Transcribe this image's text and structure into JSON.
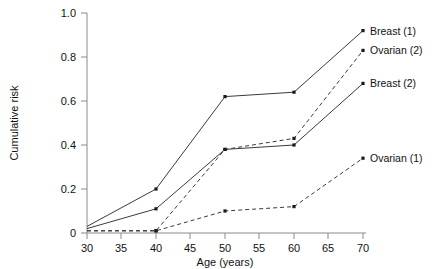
{
  "chart_data": {
    "type": "line",
    "title": "",
    "xlabel": "Age (years)",
    "ylabel": "Cumulative risk",
    "xlim": [
      30,
      70
    ],
    "ylim": [
      0,
      1.0
    ],
    "xticks": [
      30,
      35,
      40,
      45,
      50,
      55,
      60,
      65,
      70
    ],
    "xtick_labels": [
      "30",
      "35",
      "40",
      "45",
      "50",
      "55",
      "60",
      "65",
      "70"
    ],
    "yticks": [
      0,
      0.2,
      0.4,
      0.6,
      0.8,
      1.0
    ],
    "ytick_labels": [
      "0",
      "0.2",
      "0.4",
      "0.6",
      "0.8",
      "1.0"
    ],
    "grid": false,
    "legend_position": "right-inline-labels",
    "x": [
      30,
      40,
      50,
      60,
      70
    ],
    "series": [
      {
        "name": "Breast (1)",
        "label": "Breast (1)",
        "style": "solid",
        "values": [
          0.03,
          0.2,
          0.62,
          0.64,
          0.92
        ]
      },
      {
        "name": "Ovarian (2)",
        "label": "Ovarian (2)",
        "style": "dashed",
        "values": [
          0.01,
          0.01,
          0.38,
          0.43,
          0.83
        ]
      },
      {
        "name": "Breast (2)",
        "label": "Breast (2)",
        "style": "solid",
        "values": [
          0.02,
          0.11,
          0.38,
          0.4,
          0.68
        ]
      },
      {
        "name": "Ovarian (1)",
        "label": "Ovarian (1)",
        "style": "dashed",
        "values": [
          0.01,
          0.01,
          0.1,
          0.12,
          0.34
        ]
      }
    ]
  }
}
